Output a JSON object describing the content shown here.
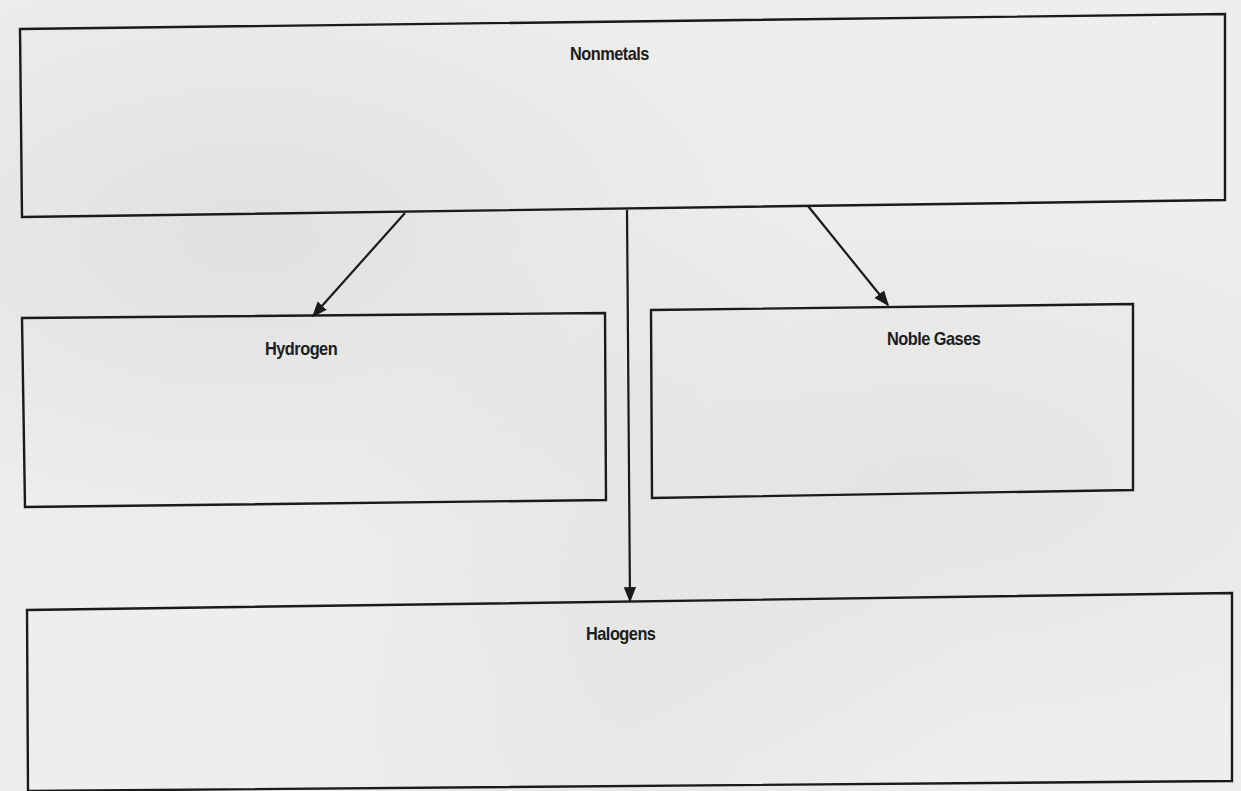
{
  "diagram": {
    "type": "concept-map",
    "colors": {
      "paper": "#eeeeec",
      "ink": "#1a1a1a"
    },
    "root": {
      "label": "Nonmetals",
      "box": [
        [
          20,
          29
        ],
        [
          1225,
          14
        ],
        [
          1225,
          200
        ],
        [
          22,
          217
        ]
      ]
    },
    "children": [
      {
        "id": "hydrogen",
        "label": "Hydrogen",
        "box": [
          [
            22,
            318
          ],
          [
            605,
            313
          ],
          [
            606,
            500
          ],
          [
            25,
            507
          ]
        ]
      },
      {
        "id": "noble-gases",
        "label": "Noble Gases",
        "box": [
          [
            651,
            310
          ],
          [
            1133,
            304
          ],
          [
            1133,
            490
          ],
          [
            652,
            498
          ]
        ]
      },
      {
        "id": "halogens",
        "label": "Halogens",
        "box": [
          [
            27,
            610
          ],
          [
            1232,
            593
          ],
          [
            1232,
            781
          ],
          [
            28,
            791
          ]
        ]
      }
    ],
    "arrows": [
      {
        "from": "Nonmetals",
        "to": "Hydrogen",
        "start": [
          405,
          213
        ],
        "end": [
          313,
          316
        ]
      },
      {
        "from": "Nonmetals",
        "to": "Noble Gases",
        "start": [
          808,
          206
        ],
        "end": [
          888,
          305
        ]
      },
      {
        "from": "Nonmetals",
        "to": "Halogens",
        "start": [
          627,
          210
        ],
        "end": [
          630,
          601
        ]
      }
    ]
  }
}
